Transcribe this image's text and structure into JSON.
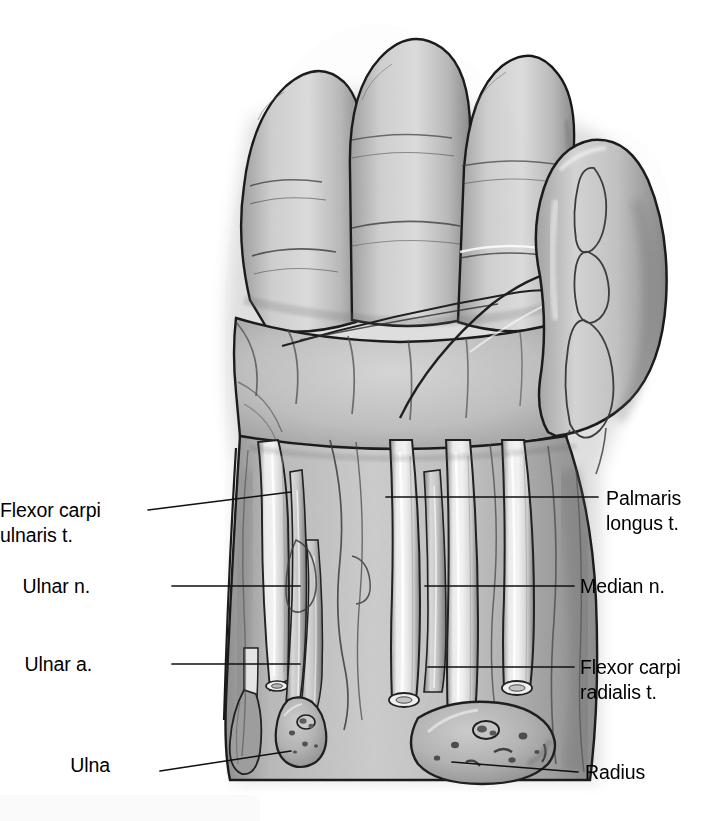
{
  "figure": {
    "kind": "anatomical-illustration",
    "style": "grayscale pencil and ink medical illustration",
    "background_color": "#ffffff",
    "ink_color": "#1a1a1a",
    "skin_tone_light": "#d8d8d8",
    "skin_tone_mid": "#b4b4b4",
    "skin_tone_dark": "#8d8d8d",
    "tendon_highlight": "#efefef",
    "bone_fill": "#b9b9b9"
  },
  "labels": {
    "left": [
      {
        "id": "flexor-carpi-ulnaris",
        "line1": "Flexor carpi",
        "line2": "ulnaris t.",
        "align": "right",
        "text_x": 22,
        "text_y": 498,
        "leader": {
          "x1": 148,
          "y1": 510,
          "x2": 291,
          "y2": 492
        }
      },
      {
        "id": "ulnar-nerve",
        "line1": "Ulnar n.",
        "line2": "",
        "align": "right",
        "text_x": 90,
        "text_y": 574,
        "leader": {
          "x1": 172,
          "y1": 586,
          "x2": 300,
          "y2": 586
        }
      },
      {
        "id": "ulnar-artery",
        "line1": "Ulnar a.",
        "line2": "",
        "align": "right",
        "text_x": 92,
        "text_y": 652,
        "leader": {
          "x1": 172,
          "y1": 664,
          "x2": 300,
          "y2": 664
        }
      },
      {
        "id": "ulna",
        "line1": "Ulna",
        "line2": "",
        "align": "right",
        "text_x": 110,
        "text_y": 753,
        "leader": {
          "x1": 160,
          "y1": 771,
          "x2": 291,
          "y2": 751
        }
      }
    ],
    "right": [
      {
        "id": "palmaris-longus",
        "line1": "Palmaris",
        "line2": "longus t.",
        "align": "left",
        "text_x": 606,
        "text_y": 486,
        "leader": {
          "x1": 386,
          "y1": 497,
          "x2": 598,
          "y2": 497
        }
      },
      {
        "id": "median-nerve",
        "line1": "Median n.",
        "line2": "",
        "align": "left",
        "text_x": 580,
        "text_y": 574,
        "leader": {
          "x1": 425,
          "y1": 586,
          "x2": 574,
          "y2": 586
        }
      },
      {
        "id": "flexor-carpi-radialis",
        "line1": "Flexor carpi",
        "line2": "radialis t.",
        "align": "left",
        "text_x": 580,
        "text_y": 655,
        "leader": {
          "x1": 428,
          "y1": 667,
          "x2": 574,
          "y2": 667
        }
      },
      {
        "id": "radius",
        "line1": "Radius",
        "line2": "",
        "align": "left",
        "text_x": 585,
        "text_y": 760,
        "leader": {
          "x1": 452,
          "y1": 762,
          "x2": 578,
          "y2": 772
        }
      }
    ]
  }
}
